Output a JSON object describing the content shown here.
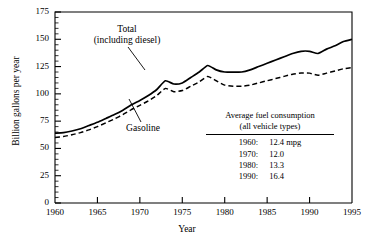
{
  "chart_data": {
    "type": "line",
    "title": "",
    "xlabel": "Year",
    "ylabel": "Billion gallons per year",
    "xlim": [
      1960,
      1995
    ],
    "ylim": [
      0,
      175
    ],
    "ytick_labels": [
      "0",
      "25",
      "50",
      "75",
      "100",
      "125",
      "150",
      "175"
    ],
    "yticks": [
      0,
      25,
      50,
      75,
      100,
      125,
      150,
      175
    ],
    "yminor_step": 5,
    "xtick_labels": [
      "1960",
      "1965",
      "1970",
      "1975",
      "1980",
      "1985",
      "1990",
      "1995"
    ],
    "xticks": [
      1960,
      1965,
      1970,
      1975,
      1980,
      1985,
      1990,
      1995
    ],
    "grid": false,
    "legend_position": "inline-annotations",
    "x": [
      1960,
      1961,
      1962,
      1963,
      1964,
      1965,
      1966,
      1967,
      1968,
      1969,
      1970,
      1971,
      1972,
      1973,
      1974,
      1975,
      1976,
      1977,
      1978,
      1979,
      1980,
      1981,
      1982,
      1983,
      1984,
      1985,
      1986,
      1987,
      1988,
      1989,
      1990,
      1991,
      1992,
      1993,
      1994,
      1995
    ],
    "series": [
      {
        "name": "Total (including diesel)",
        "style": "solid",
        "values": [
          64,
          64.5,
          66,
          68,
          71,
          74,
          77.5,
          81,
          85,
          90,
          94,
          98.5,
          104,
          112,
          109,
          110,
          115,
          120,
          126,
          122,
          120,
          120,
          120,
          122,
          125,
          128,
          131,
          134,
          137,
          139,
          139,
          137,
          141,
          144,
          148,
          150
        ]
      },
      {
        "name": "Gasoline",
        "style": "dashed",
        "values": [
          60,
          61,
          62.5,
          64.5,
          67,
          70,
          73.5,
          77,
          81,
          85.5,
          89.5,
          93.5,
          98.5,
          105,
          102,
          103,
          107,
          111,
          116,
          112,
          108,
          107,
          107,
          108,
          110,
          112,
          114,
          116,
          118,
          119,
          119,
          117,
          119,
          121,
          123,
          124
        ]
      }
    ],
    "annotations": [
      {
        "name": "total-label",
        "line1": "Total",
        "line2": "(including diesel)"
      },
      {
        "name": "gasoline-label",
        "text": "Gasoline"
      }
    ]
  },
  "legend": {
    "header_line1": "Average fuel consumption",
    "header_line2": "(all vehicle types)",
    "rows": [
      {
        "year": "1960:",
        "value": "12.4 mpg"
      },
      {
        "year": "1970:",
        "value": "12.0"
      },
      {
        "year": "1980:",
        "value": "13.3"
      },
      {
        "year": "1990:",
        "value": "16.4"
      }
    ]
  },
  "colors": {
    "ink": "#000000",
    "background": "#ffffff"
  }
}
